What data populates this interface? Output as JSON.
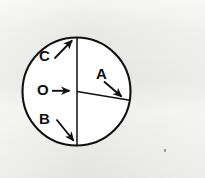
{
  "figure": {
    "background_color": "#ececea",
    "ink_color": "#111111",
    "fill_color": "#ffffff",
    "labels": {
      "center": "O",
      "radius": "A",
      "lower_half_diameter": "B",
      "arc_upper": "C"
    },
    "geometry": {
      "circle": {
        "cx": 76.5,
        "cy": 91.5,
        "r": 54
      },
      "vertical_diameter": {
        "x1": 77,
        "y1": 37.5,
        "x2": 77,
        "y2": 145.5
      },
      "horizontal_radius": {
        "x1": 77,
        "y1": 91.5,
        "x2": 130,
        "y2": 100
      }
    },
    "pointers": [
      {
        "name": "arrow-to-center",
        "label": "O",
        "from": [
          52,
          91
        ],
        "to": [
          70,
          91
        ]
      },
      {
        "name": "arrow-to-radius-end",
        "label": "A",
        "from": [
          104,
          82
        ],
        "to": [
          122,
          97
        ]
      },
      {
        "name": "arrow-to-lower-diameter",
        "label": "B",
        "from": [
          57,
          120
        ],
        "to": [
          74,
          141
        ]
      },
      {
        "name": "arrow-to-upper-arc",
        "label": "C",
        "from": [
          55,
          59
        ],
        "to": [
          72,
          41
        ]
      }
    ]
  }
}
